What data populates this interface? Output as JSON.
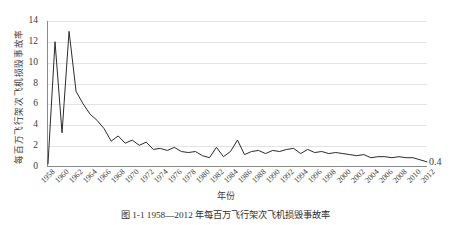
{
  "chart_data": {
    "type": "line",
    "title": "",
    "xlabel": "年份",
    "ylabel": "每百万飞行架次飞机损毁事故率",
    "ylim": [
      0,
      14
    ],
    "yticks": [
      0,
      2,
      4,
      6,
      8,
      10,
      12,
      14
    ],
    "grid": true,
    "legend": null,
    "xlim": [
      1958,
      2012
    ],
    "xtick_labels": [
      "1958",
      "1960",
      "1962",
      "1964",
      "1966",
      "1968",
      "1970",
      "1972",
      "1974",
      "1976",
      "1978",
      "1980",
      "1982",
      "1984",
      "1986",
      "1988",
      "1990",
      "1992",
      "1994",
      "1996",
      "1998",
      "2000",
      "2002",
      "2004",
      "2006",
      "2008",
      "2010",
      "2012"
    ],
    "x": [
      1958,
      1959,
      1960,
      1961,
      1962,
      1963,
      1964,
      1965,
      1966,
      1967,
      1968,
      1969,
      1970,
      1971,
      1972,
      1973,
      1974,
      1975,
      1976,
      1977,
      1978,
      1979,
      1980,
      1981,
      1982,
      1983,
      1984,
      1985,
      1986,
      1987,
      1988,
      1989,
      1990,
      1991,
      1992,
      1993,
      1994,
      1995,
      1996,
      1997,
      1998,
      1999,
      2000,
      2001,
      2002,
      2003,
      2004,
      2005,
      2006,
      2007,
      2008,
      2009,
      2010,
      2011,
      2012
    ],
    "values": [
      0.2,
      12.0,
      3.2,
      13.0,
      7.2,
      6.0,
      5.0,
      4.4,
      3.6,
      2.4,
      2.9,
      2.2,
      2.5,
      2.0,
      2.3,
      1.6,
      1.7,
      1.5,
      1.8,
      1.4,
      1.3,
      1.4,
      1.0,
      0.8,
      1.8,
      0.9,
      1.4,
      2.5,
      1.1,
      1.4,
      1.5,
      1.2,
      1.5,
      1.4,
      1.6,
      1.7,
      1.2,
      1.6,
      1.3,
      1.4,
      1.2,
      1.3,
      1.2,
      1.1,
      1.0,
      1.1,
      0.8,
      0.9,
      0.9,
      0.8,
      0.9,
      0.8,
      0.8,
      0.6,
      0.4
    ],
    "annotations": [
      {
        "text": "0.4",
        "x": 2012,
        "y": 0.4
      }
    ]
  },
  "axes": {
    "y_tick_labels": [
      "0",
      "2",
      "4",
      "6",
      "8",
      "10",
      "12",
      "14"
    ],
    "y_title": "每百万飞行架次飞机损毁事故率",
    "x_title": "年份"
  },
  "caption": {
    "text": "图 1-1  1958—2012 年每百万飞行架次飞机损毁事故率"
  },
  "style": {
    "line_color": "#2b2b2b",
    "grid_color": "#e3e3e3",
    "axis_color": "#8a8a8a",
    "text_color": "#3a3a3a",
    "background": "#ffffff"
  }
}
